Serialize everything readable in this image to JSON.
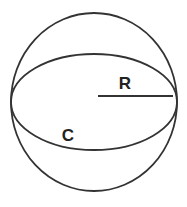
{
  "diagram": {
    "labels": {
      "radius": "R",
      "circumference": "C"
    },
    "colors": {
      "stroke": "#333333",
      "text": "#222222",
      "background": "#ffffff"
    },
    "shapes": {
      "sphere_outline": {
        "cx": 94,
        "cy": 102,
        "rx": 83,
        "ry": 89
      },
      "equator_ellipse": {
        "cx": 94,
        "cy": 102,
        "rx": 83,
        "ry": 48
      },
      "radius_line": {
        "x1": 98,
        "y1": 96,
        "x2": 173,
        "y2": 96
      }
    }
  }
}
